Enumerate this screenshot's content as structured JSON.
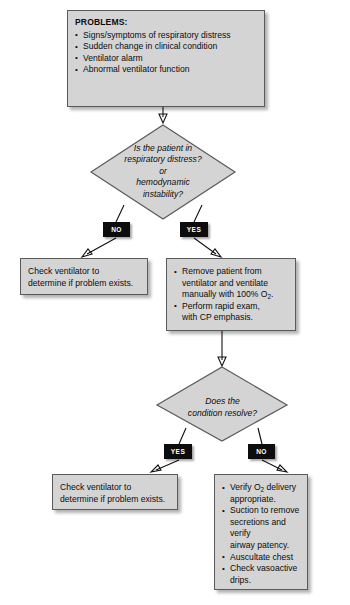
{
  "diagram": {
    "type": "clinical-flowchart",
    "background_color": "#ffffff",
    "node_fill_color": "#d4d4d4",
    "node_border_color": "#5a5a5a",
    "badge_background_color": "#0d0d0d",
    "badge_text_color": "#ffffff"
  },
  "problems_box": {
    "heading": "PROBLEMS:",
    "items": [
      "Signs/symptoms of respiratory distress",
      "Sudden change in clinical condition",
      "Ventilator alarm",
      "Abnormal ventilator function"
    ]
  },
  "decision_one": {
    "line1": "Is the patient in",
    "line2": "respiratory distress?",
    "line3": "or",
    "line4": "hemodynamic",
    "line5": "instability?",
    "branch_left_label": "NO",
    "branch_right_label": "YES"
  },
  "check_ventilator_box_left": {
    "line1": "Check ventilator to",
    "line2": "determine if problem exists."
  },
  "remove_patient_box": {
    "items": [
      "Remove patient from ventilator and ventilate manually with 100% O2.",
      "Perform rapid exam, with CP emphasis."
    ],
    "item1_line1": "Remove patient from",
    "item1_line2": "ventilator and ventilate",
    "item1_line3_pre": "manually with 100% O",
    "item1_line3_sub": "2",
    "item1_line3_post": ".",
    "item2_line1": "Perform rapid exam,",
    "item2_line2": "with CP emphasis."
  },
  "decision_two": {
    "line1": "Does the",
    "line2": "condition resolve?",
    "branch_left_label": "YES",
    "branch_right_label": "NO"
  },
  "check_ventilator_box_bottom": {
    "line1": "Check ventilator to",
    "line2": "determine if problem exists."
  },
  "verify_box": {
    "item1_pre": "Verify O",
    "item1_sub": "2",
    "item1_post": " delivery",
    "item1_line2": "appropriate.",
    "item2_line1": "Suction to remove",
    "item2_line2": "secretions and verify",
    "item2_line3": "airway patency.",
    "item3_line1": "Auscultate chest",
    "item4_line1": "Check vasoactive",
    "item4_line2": "drips."
  }
}
